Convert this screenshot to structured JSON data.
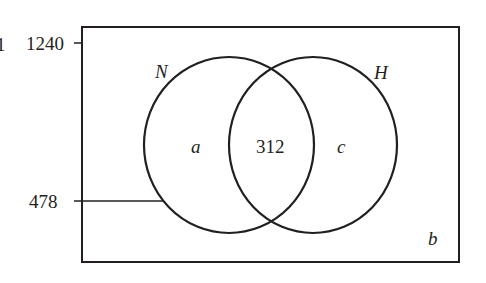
{
  "diagram": {
    "type": "venn",
    "axis_labels": {
      "top": "1240",
      "lower": "478"
    },
    "sets": [
      {
        "name": "N",
        "region_label": "a"
      },
      {
        "name": "H",
        "region_label": "c"
      }
    ],
    "intersection_value": "312",
    "outside_label": "b",
    "edge_fragment": "1"
  },
  "colors": {
    "stroke": "#231f20",
    "background": "#ffffff"
  }
}
